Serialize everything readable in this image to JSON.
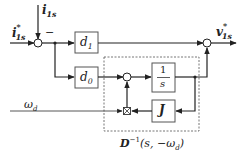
{
  "diagram": {
    "type": "block-diagram",
    "inputs": {
      "reference_current": {
        "symbol": "i",
        "sup": "*",
        "sub": "1s"
      },
      "feedback_current": {
        "symbol": "i",
        "sub": "1s"
      },
      "frequency": {
        "symbol": "ω",
        "sub": "d"
      }
    },
    "output": {
      "symbol": "v",
      "sup": "*",
      "sub": "1s"
    },
    "sum_sign_minus": "−",
    "blocks": {
      "d1": {
        "main": "d",
        "sub": "1"
      },
      "d0": {
        "main": "d",
        "sub": "0"
      },
      "integrator": {
        "num": "1",
        "den": "s"
      },
      "j": {
        "main": "J"
      }
    },
    "subsystem_label": {
      "main": "D",
      "sup": "−1",
      "args": "(s, −ω",
      "args_sub": "d",
      "args_close": ")"
    }
  }
}
